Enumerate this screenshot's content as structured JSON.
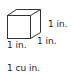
{
  "diagram": {
    "shape": "cube",
    "labels": {
      "height": "1 in.",
      "depth": "1 in.",
      "width": "1 in.",
      "volume": "1 cu in."
    },
    "stroke_color": "#333333"
  }
}
